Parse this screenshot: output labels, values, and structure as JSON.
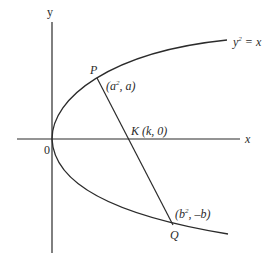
{
  "diagram": {
    "type": "geometry",
    "axes": {
      "x_label": "x",
      "y_label": "y",
      "origin_label": "0"
    },
    "curve": {
      "equation_lhs": "y",
      "equation_exp": "2",
      "equation_rhs": " = x"
    },
    "points": {
      "P": {
        "name": "P",
        "coord_open": "(a",
        "coord_exp": "2",
        "coord_close": ", a)"
      },
      "Q": {
        "name": "Q",
        "coord_open": "(b",
        "coord_exp": "2",
        "coord_close": ", –b)"
      },
      "K": {
        "name": "K",
        "coord": "(k, 0)"
      }
    },
    "colors": {
      "line": "#2b2b2b",
      "background": "#ffffff"
    }
  }
}
